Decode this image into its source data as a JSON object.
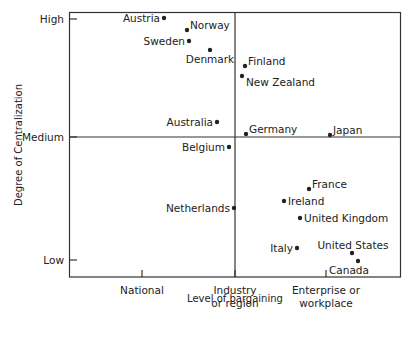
{
  "chart_data": {
    "type": "scatter",
    "title": "",
    "xlabel": "Level of bargaining",
    "ylabel": "Degree of Centralization",
    "x_ticks": [
      {
        "label_lines": [
          "National"
        ],
        "x": 142
      },
      {
        "label_lines": [
          "Industry",
          "or region"
        ],
        "x": 235
      },
      {
        "label_lines": [
          "Enterprise or",
          "workplace"
        ],
        "x": 326
      }
    ],
    "y_ticks": [
      {
        "label": "High",
        "y": 19
      },
      {
        "label": "Medium",
        "y": 137
      },
      {
        "label": "Low",
        "y": 260
      }
    ],
    "grid": false,
    "quadrant_lines": {
      "vertical_at": "Industry or region",
      "horizontal_at": "Medium"
    },
    "legend": null,
    "points": [
      {
        "name": "Austria",
        "px": 164,
        "py": 18,
        "label_side": "left"
      },
      {
        "name": "Norway",
        "px": 187,
        "py": 30,
        "label_side": "right-up"
      },
      {
        "name": "Sweden",
        "px": 189,
        "py": 41,
        "label_side": "left"
      },
      {
        "name": "Denmark",
        "px": 210,
        "py": 50,
        "label_side": "below"
      },
      {
        "name": "Finland",
        "px": 245,
        "py": 66,
        "label_side": "right-up"
      },
      {
        "name": "New Zealand",
        "px": 242,
        "py": 76,
        "label_side": "right-down"
      },
      {
        "name": "Australia",
        "px": 217,
        "py": 122,
        "label_side": "left"
      },
      {
        "name": "Germany",
        "px": 246,
        "py": 134,
        "label_side": "right-up"
      },
      {
        "name": "Japan",
        "px": 330,
        "py": 135,
        "label_side": "right-up"
      },
      {
        "name": "Belgium",
        "px": 229,
        "py": 147,
        "label_side": "left"
      },
      {
        "name": "France",
        "px": 309,
        "py": 189,
        "label_side": "right-up"
      },
      {
        "name": "Ireland",
        "px": 284,
        "py": 201,
        "label_side": "right"
      },
      {
        "name": "Netherlands",
        "px": 234,
        "py": 208,
        "label_side": "left"
      },
      {
        "name": "United Kingdom",
        "px": 300,
        "py": 218,
        "label_side": "right"
      },
      {
        "name": "Italy",
        "px": 297,
        "py": 248,
        "label_side": "left"
      },
      {
        "name": "United States",
        "px": 352,
        "py": 253,
        "label_side": "above"
      },
      {
        "name": "Canada",
        "px": 358,
        "py": 261,
        "label_side": "below"
      }
    ]
  },
  "colors": {
    "ink": "#222222",
    "background": "#ffffff"
  }
}
